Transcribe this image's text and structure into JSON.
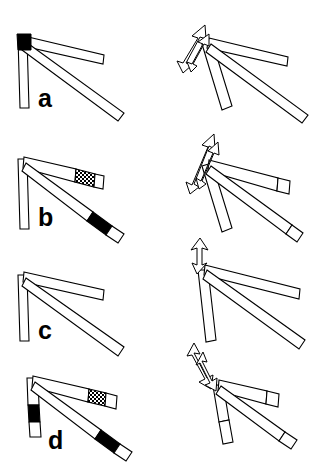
{
  "figure": {
    "width": 317,
    "height": 472,
    "background_color": "#ffffff",
    "stroke_color": "#000000",
    "marker_fill_color": "#000000",
    "arm_fill_color": "#ffffff"
  },
  "panels": [
    {
      "id": "a",
      "label": "a",
      "label_x": 38,
      "label_y": 86,
      "markers": [
        "shoulder-joint-solid"
      ],
      "marker_count": 1,
      "arrows": "two-double-headed-curved-arrows-up-left",
      "arrow_direction": "up-left",
      "arrow_count": 2
    },
    {
      "id": "b",
      "label": "b",
      "label_x": 38,
      "label_y": 205,
      "markers": [
        "upper-link-tip-hatched",
        "lower-link-tip-solid"
      ],
      "marker_count": 2,
      "arrows": "two-double-headed-arrows-up-right",
      "arrow_direction": "up-right",
      "arrow_count": 2
    },
    {
      "id": "c",
      "label": "c",
      "label_x": 38,
      "label_y": 318,
      "markers": [],
      "marker_count": 0,
      "arrows": "one-double-headed-arrow-vertical-up",
      "arrow_direction": "up",
      "arrow_count": 1
    },
    {
      "id": "d",
      "label": "d",
      "label_x": 48,
      "label_y": 428,
      "markers": [
        "vertical-link-tip-solid",
        "upper-link-tip-hatched",
        "lower-link-tip-solid"
      ],
      "marker_count": 3,
      "arrows": "two-double-headed-arrows-down",
      "arrow_direction": "down",
      "arrow_count": 2
    }
  ],
  "columns": [
    {
      "id": "left",
      "name": "arm-configuration-column",
      "has_arrows": false
    },
    {
      "id": "right",
      "name": "arm-motion-column",
      "has_arrows": true
    }
  ]
}
